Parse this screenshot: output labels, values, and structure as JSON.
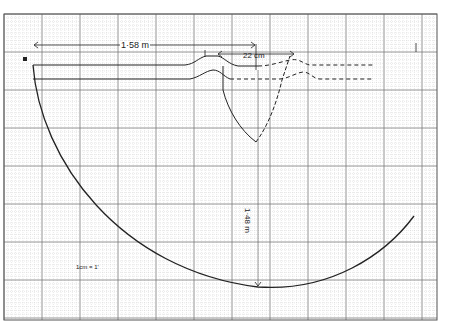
{
  "diagram": {
    "type": "engineering-sketch-on-graph-paper",
    "background": "#ffffff",
    "grid": {
      "x0": 4,
      "y0": 14,
      "x1": 437,
      "y1": 320,
      "minor_step": 3.8,
      "major_step": 38,
      "minor_color": "#c8c8c8",
      "major_color": "#7a7a7a",
      "border_color": "#555555"
    },
    "stroke_color": "#222222",
    "labels": {
      "width_dim": "1·58 m",
      "gap_dim": "22 cm",
      "depth_dim": "1·48 m",
      "scale_note": "1cm = 1'",
      "corner_mark": "B"
    },
    "shapes": {
      "arc": {
        "start": [
          33,
          65
        ],
        "bottom": [
          258,
          287
        ],
        "end": [
          414,
          216
        ]
      },
      "upper_line_y": 65,
      "lower_line_y": 79,
      "v_bottom": [
        256,
        142
      ],
      "dashed_end_x": 373
    }
  }
}
